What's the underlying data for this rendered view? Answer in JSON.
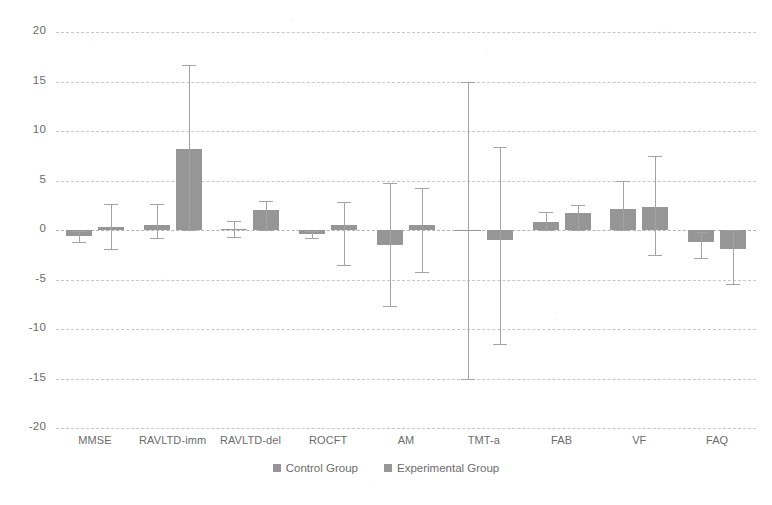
{
  "chart_data": {
    "type": "bar",
    "title": "",
    "subtitle": "",
    "xlabel": "",
    "ylabel": "",
    "ylim": [
      -20,
      20
    ],
    "ytick_values": [
      20,
      15,
      10,
      5,
      0,
      -5,
      -10,
      -15,
      -20
    ],
    "ytick_labels": [
      "20",
      "15",
      "10",
      "5",
      "0",
      "-5",
      "-10",
      "-15",
      "-20"
    ],
    "grid": true,
    "legend_position": "bottom",
    "categories": [
      "MMSE",
      "RAVLTD-imm",
      "RAVLTD-del",
      "ROCFT",
      "AM",
      "TMT-a",
      "FAB",
      "VF",
      "FAQ"
    ],
    "series": [
      {
        "name": "Control Group",
        "color": "#969696",
        "values": [
          -0.6,
          0.5,
          0.1,
          -0.4,
          -1.5,
          0.0,
          0.8,
          2.1,
          -1.2
        ],
        "err_low": [
          -1.2,
          -0.8,
          -0.7,
          -0.8,
          -7.7,
          -15.1,
          0.0,
          0.0,
          -2.8
        ],
        "err_high": [
          -0.1,
          2.6,
          0.9,
          -0.1,
          4.7,
          14.9,
          1.8,
          5.0,
          -0.2
        ]
      },
      {
        "name": "Experimental Group",
        "color": "#969696",
        "values": [
          0.3,
          8.2,
          2.0,
          0.5,
          0.5,
          -1.0,
          1.7,
          2.3,
          -1.9
        ],
        "err_low": [
          -1.9,
          0.0,
          0.0,
          -3.5,
          -4.2,
          -11.5,
          0.0,
          -2.5,
          -5.5
        ],
        "err_high": [
          2.6,
          16.7,
          2.9,
          2.8,
          4.2,
          8.4,
          2.5,
          7.5,
          0.0
        ]
      }
    ]
  },
  "legend": {
    "entries": [
      {
        "label": "Control Group"
      },
      {
        "label": "Experimental Group"
      }
    ]
  },
  "colors": {
    "bar_fill": "#969696",
    "whisker": "#a3a3a3",
    "gridline": "#b4b4b4",
    "text": "#6b6b6b",
    "background": "#ffffff"
  }
}
